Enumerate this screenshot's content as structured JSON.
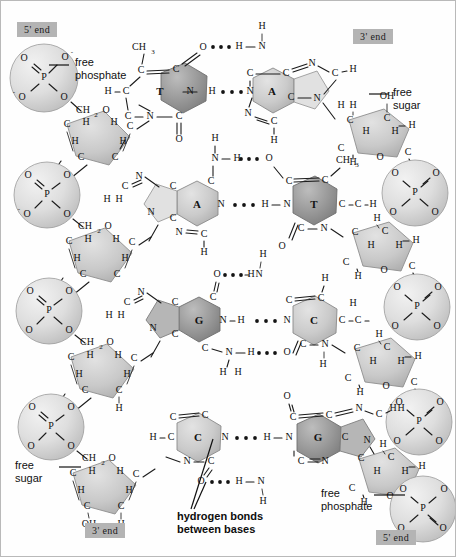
{
  "figure": {
    "background": "#ffffff",
    "border_color": "#b9b9b9",
    "width": 456,
    "height": 557
  },
  "end_labels": [
    {
      "id": "top-left",
      "text": "5' end",
      "x": 16,
      "y": 21
    },
    {
      "id": "top-right",
      "text": "3' end",
      "x": 352,
      "y": 28
    },
    {
      "id": "bottom-left",
      "text": "3' end",
      "x": 84,
      "y": 522
    },
    {
      "id": "bottom-right",
      "text": "5' end",
      "x": 375,
      "y": 529
    }
  ],
  "annotations": [
    {
      "id": "free-phosphate-top",
      "lines": [
        "free",
        "phosphate"
      ],
      "x": 74,
      "y": 63
    },
    {
      "id": "free-sugar-top",
      "lines": [
        "free",
        "sugar"
      ],
      "x": 392,
      "y": 92
    },
    {
      "id": "free-sugar-bottom",
      "lines": [
        "free",
        "sugar"
      ],
      "x": 30,
      "y": 465
    },
    {
      "id": "free-phosphate-bottom",
      "lines": [
        "free",
        "phosphate"
      ],
      "x": 325,
      "y": 492
    },
    {
      "id": "hydrogen-bond-caption",
      "lines": [
        "hydrogen bonds",
        "between bases"
      ],
      "x": 176,
      "y": 516
    }
  ],
  "strands": {
    "left": {
      "direction": "5' to 3'",
      "bases": [
        "T",
        "A",
        "G",
        "C"
      ]
    },
    "right": {
      "direction": "3' to 5'",
      "bases": [
        "A",
        "T",
        "C",
        "G"
      ]
    }
  },
  "base_pairs": [
    {
      "row": 1,
      "left": "T",
      "right": "A",
      "hydrogen_bonds": 2
    },
    {
      "row": 2,
      "left": "A",
      "right": "T",
      "hydrogen_bonds": 2
    },
    {
      "row": 3,
      "left": "G",
      "right": "C",
      "hydrogen_bonds": 3
    },
    {
      "row": 4,
      "left": "C",
      "right": "G",
      "hydrogen_bonds": 3
    }
  ],
  "chemistry": {
    "phosphate_atoms": {
      "center": "P",
      "upper_left": "O",
      "upper_right": "O",
      "lower_left": "O",
      "lower_right": "O"
    },
    "sugar_atoms": {
      "ring_oxygen": "O",
      "carbons": "C",
      "hydrogens": "H",
      "methylene": "CH2",
      "hydroxyl": "OH"
    },
    "thymine_methyl": "CH3",
    "labels": {
      "carbon": "C",
      "nitrogen": "N",
      "oxygen": "O",
      "hydrogen": "H",
      "phosphorus": "P"
    }
  },
  "colors": {
    "base_dark": "#8d8d8d",
    "base_mid": "#a8a8a8",
    "base_light": "#cfcfcf",
    "sugar_fill": "#c6c6c6",
    "phosphate_fill": "#dcdcdc",
    "tag_gray": "#b4b4b4",
    "ink": "#1a1a1a"
  }
}
